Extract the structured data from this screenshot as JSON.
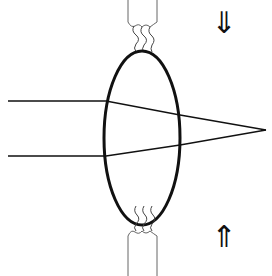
{
  "diagram": {
    "type": "lens-accommodation",
    "colors": {
      "stroke": "#111111",
      "thin_stroke": "#555555",
      "background": "#ffffff"
    },
    "arrows": {
      "top": {
        "glyph": "⇓",
        "direction": "down"
      },
      "bottom": {
        "glyph": "⇑",
        "direction": "up"
      }
    },
    "elements": [
      "top ciliary stalk",
      "top zonule fibers",
      "lens ellipse",
      "incoming ray upper",
      "incoming ray lower",
      "focal point",
      "bottom zonule fibers",
      "bottom ciliary stalk"
    ]
  }
}
